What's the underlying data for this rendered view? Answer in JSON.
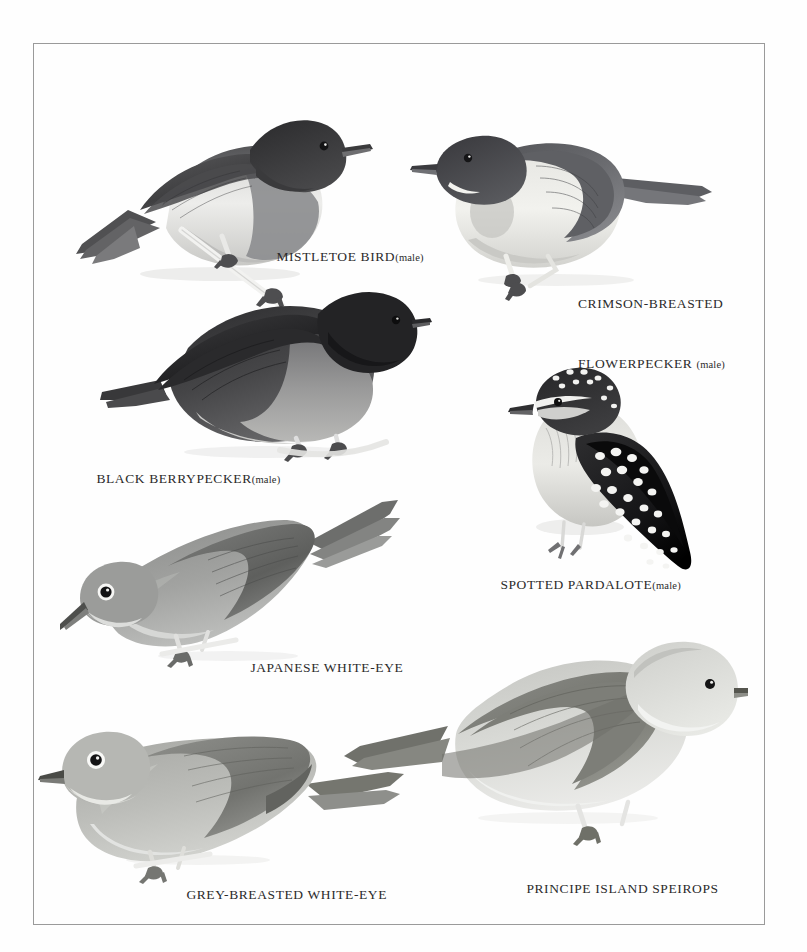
{
  "plate": {
    "kind": "field-guide-plate",
    "background_color": "#fefefe",
    "frame_color": "#9a9a9a",
    "caption_color": "#2b2b2b",
    "style": "grayscale-halftone-illustration"
  },
  "birds": [
    {
      "id": "mistletoe-bird",
      "name": "MISTLETOE BIRD",
      "sex": "(male)",
      "caption_lines": [
        "MISTLETOE BIRD (male)"
      ],
      "facing": "right",
      "notes": "dark head and back, pale belly, dark breast band, perched on pale twig"
    },
    {
      "id": "crimson-breasted-flowerpecker",
      "name": "CRIMSON-BREASTED FLOWERPECKER",
      "sex": "(male)",
      "caption_lines": [
        "CRIMSON-BREASTED",
        "FLOWERPECKER (male)"
      ],
      "facing": "left",
      "notes": "dark grey upperparts, cream underparts, white malar streak"
    },
    {
      "id": "black-berrypecker",
      "name": "BLACK BERRYPECKER",
      "sex": "(male)",
      "caption_lines": [
        "BLACK BERRYPECKER (male)"
      ],
      "facing": "right",
      "notes": "blackish overall with mid-grey flanks and breast"
    },
    {
      "id": "spotted-pardalote",
      "name": "SPOTTED PARDALOTE",
      "sex": "(male)",
      "caption_lines": [
        "SPOTTED PARDALOTE (male)"
      ],
      "facing": "left",
      "notes": "black crown, wings and tail heavily covered with white spots, pale underparts"
    },
    {
      "id": "japanese-white-eye",
      "name": "JAPANESE WHITE-EYE",
      "sex": "",
      "caption_lines": [
        "JAPANESE WHITE-EYE"
      ],
      "facing": "left",
      "notes": "bold white eye-ring, mid grey body, head angled downward"
    },
    {
      "id": "grey-breasted-white-eye",
      "name": "GREY-BREASTED WHITE-EYE",
      "sex": "",
      "caption_lines": [
        "GREY-BREASTED WHITE-EYE"
      ],
      "facing": "left",
      "notes": "bold white eye-ring, pale grey-brown body"
    },
    {
      "id": "principe-island-speirops",
      "name": "PRINCIPE ISLAND SPEIROPS",
      "sex": "",
      "caption_lines": [
        "PRINCIPE ISLAND SPEIROPS"
      ],
      "facing": "right",
      "notes": "large pale head, mid-grey wings and tail, whitish underparts"
    }
  ]
}
